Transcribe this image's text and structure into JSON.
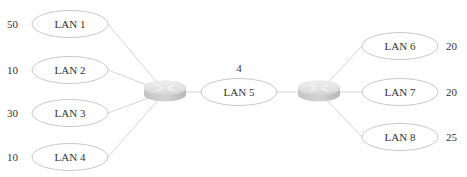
{
  "diagram": {
    "routers": [
      {
        "id": "router-left",
        "cx": 165,
        "cy": 92
      },
      {
        "id": "router-right",
        "cx": 319,
        "cy": 92
      }
    ],
    "lans": [
      {
        "label": "LAN 1",
        "count": "50",
        "cx": 70,
        "cy": 24,
        "side": "left",
        "router": 0
      },
      {
        "label": "LAN 2",
        "count": "10",
        "cx": 70,
        "cy": 70,
        "side": "left",
        "router": 0
      },
      {
        "label": "LAN 3",
        "count": "30",
        "cx": 70,
        "cy": 113,
        "side": "left",
        "router": 0
      },
      {
        "label": "LAN 4",
        "count": "10",
        "cx": 70,
        "cy": 157,
        "side": "left",
        "router": 0
      },
      {
        "label": "LAN 5",
        "count": "4",
        "cx": 239,
        "cy": 92,
        "side": "top",
        "router": -1
      },
      {
        "label": "LAN 6",
        "count": "20",
        "cx": 400,
        "cy": 46,
        "side": "right",
        "router": 1
      },
      {
        "label": "LAN 7",
        "count": "20",
        "cx": 400,
        "cy": 92,
        "side": "right",
        "router": 1
      },
      {
        "label": "LAN 8",
        "count": "25",
        "cx": 400,
        "cy": 137,
        "side": "right",
        "router": 1
      }
    ],
    "colors": {
      "ellipse_stroke": "#c8c8c8",
      "link": "#d4d4d4",
      "router_top": "#e6e6e6",
      "router_side": "#bdbdbd",
      "text": "#333333"
    }
  }
}
